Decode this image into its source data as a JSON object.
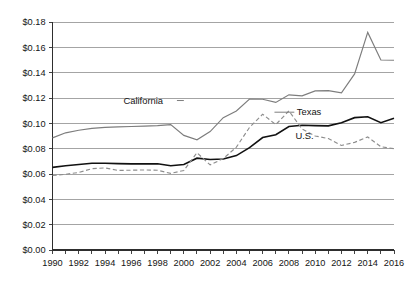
{
  "chart_data": {
    "type": "line",
    "title": "",
    "subtitle": "",
    "xlabel": "",
    "ylabel": "",
    "grid": "horizontal",
    "legend_position": "inline-annotations",
    "xlim": [
      1990,
      2016
    ],
    "ylim": [
      0.0,
      0.18
    ],
    "y_tick_step": 0.02,
    "x_tick_step": 1,
    "x_label_step": 2,
    "x": [
      1990,
      1991,
      1992,
      1993,
      1994,
      1995,
      1996,
      1997,
      1998,
      1999,
      2000,
      2001,
      2002,
      2003,
      2004,
      2005,
      2006,
      2007,
      2008,
      2009,
      2010,
      2011,
      2012,
      2013,
      2014,
      2015,
      2016
    ],
    "xticklabels": [
      "1990",
      "1992",
      "1994",
      "1996",
      "1998",
      "2000",
      "2002",
      "2004",
      "2006",
      "2008",
      "2010",
      "2012",
      "2014",
      "2016"
    ],
    "yticklabels": [
      "$0.00",
      "$0.02",
      "$0.04",
      "$0.06",
      "$0.08",
      "$0.10",
      "$0.12",
      "$0.14",
      "$0.16",
      "$0.18"
    ],
    "series": [
      {
        "name": "California",
        "style": "solid-gray",
        "color": "#7d7d7d",
        "values": [
          0.0885,
          0.0925,
          0.0945,
          0.096,
          0.0968,
          0.0972,
          0.0975,
          0.0978,
          0.0982,
          0.099,
          0.0905,
          0.087,
          0.0935,
          0.1045,
          0.1098,
          0.1192,
          0.119,
          0.1165,
          0.1225,
          0.1217,
          0.1256,
          0.1258,
          0.124,
          0.139,
          0.1718,
          0.15,
          0.1498
        ]
      },
      {
        "name": "U.S.",
        "style": "solid-black",
        "color": "#111111",
        "values": [
          0.0652,
          0.0665,
          0.0675,
          0.0685,
          0.0685,
          0.0682,
          0.068,
          0.068,
          0.0681,
          0.0665,
          0.0675,
          0.0725,
          0.0715,
          0.0718,
          0.0745,
          0.0808,
          0.0888,
          0.091,
          0.0975,
          0.0985,
          0.0982,
          0.098,
          0.1005,
          0.1045,
          0.1052,
          0.1005,
          0.104
        ]
      },
      {
        "name": "Texas",
        "style": "dashed-gray",
        "color": "#8d8d8d",
        "values": [
          0.0588,
          0.0598,
          0.0612,
          0.0642,
          0.0648,
          0.0628,
          0.063,
          0.0632,
          0.063,
          0.0605,
          0.0628,
          0.0768,
          0.0672,
          0.0722,
          0.0812,
          0.0968,
          0.1072,
          0.099,
          0.1098,
          0.0955,
          0.09,
          0.088,
          0.0825,
          0.085,
          0.0892,
          0.0815,
          0.08
        ]
      }
    ],
    "annotations": [
      {
        "text": "California",
        "series": "California",
        "label_x": 1995.4,
        "label_y": 0.118,
        "leader_to_x": 2000.0,
        "leader_to_y": 0.118
      },
      {
        "text": "Texas",
        "series": "Texas",
        "label_x": 2008.6,
        "label_y": 0.1088,
        "leader_to_x": 2006.9,
        "leader_to_y": 0.1088
      },
      {
        "text": "U.S.",
        "series": "U.S.",
        "label_x": 2008.5,
        "label_y": 0.09,
        "leader_to_x": null,
        "leader_to_y": null
      }
    ]
  }
}
